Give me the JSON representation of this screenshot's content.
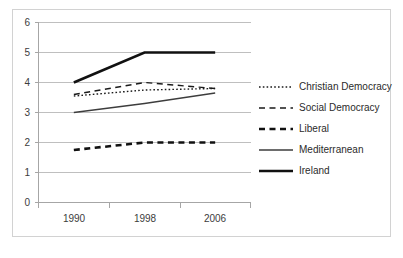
{
  "chart_data": {
    "type": "line",
    "title": "",
    "xlabel": "",
    "ylabel": "",
    "categories": [
      "1990",
      "1998",
      "2006"
    ],
    "ylim": [
      0,
      6
    ],
    "yticks": [
      "0",
      "1",
      "2",
      "3",
      "4",
      "5",
      "6"
    ],
    "grid": "horizontal",
    "legend_position": "right",
    "series": [
      {
        "name": "Christian Democracy",
        "values": [
          3.55,
          3.75,
          3.8
        ],
        "style": "dotted",
        "width": 1.4,
        "color": "#1a1a1a"
      },
      {
        "name": "Social Democracy",
        "values": [
          3.6,
          4.0,
          3.8
        ],
        "style": "dashed-medium",
        "width": 1.4,
        "color": "#1a1a1a"
      },
      {
        "name": "Liberal",
        "values": [
          1.75,
          2.0,
          2.0
        ],
        "style": "dashed-bold",
        "width": 2.6,
        "color": "#111111"
      },
      {
        "name": "Mediterranean",
        "values": [
          3.0,
          3.3,
          3.65
        ],
        "style": "solid-thin",
        "width": 1.3,
        "color": "#3d3d3d"
      },
      {
        "name": "Ireland",
        "values": [
          4.0,
          5.0,
          5.0
        ],
        "style": "solid-bold",
        "width": 2.6,
        "color": "#111111"
      }
    ]
  },
  "axes": {
    "y_tick_labels": [
      "6",
      "5",
      "4",
      "3",
      "2",
      "1",
      "0"
    ],
    "x_tick_labels": [
      "1990",
      "1998",
      "2006"
    ]
  },
  "legend": {
    "entries": [
      {
        "label": "Christian Democracy"
      },
      {
        "label": "Social Democracy"
      },
      {
        "label": "Liberal"
      },
      {
        "label": "Mediterranean"
      },
      {
        "label": "Ireland"
      }
    ]
  },
  "colors": {
    "grid": "#bfbfbf",
    "axis": "#a6a6a6",
    "frame": "#d2d2d2",
    "text": "#3c3c3c",
    "background": "#ffffff"
  }
}
